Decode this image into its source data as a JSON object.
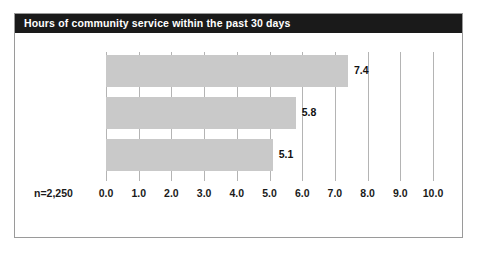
{
  "chart_data": {
    "type": "bar",
    "orientation": "horizontal",
    "title": "Hours of community service within the past 30 days",
    "categories": [
      "Heavy users",
      "Light users",
      "Nonusers"
    ],
    "values": [
      7.4,
      5.8,
      5.1
    ],
    "value_labels": [
      "7.4",
      "5.8",
      "5.1"
    ],
    "xlabel": "",
    "ylabel": "",
    "xlim": [
      0.0,
      10.0
    ],
    "xticks": [
      0.0,
      1.0,
      2.0,
      3.0,
      4.0,
      5.0,
      6.0,
      7.0,
      8.0,
      9.0,
      10.0
    ],
    "xtick_labels": [
      "0.0",
      "1.0",
      "2.0",
      "3.0",
      "4.0",
      "5.0",
      "6.0",
      "7.0",
      "8.0",
      "9.0",
      "10.0"
    ],
    "grid": "vertical",
    "legend": null,
    "annotation": "n=2,250",
    "bar_color": "#c9c9c9",
    "title_bar_color": "#1a1a1a",
    "title_text_color": "#ffffff",
    "gridline_color": "#b4b4b4",
    "frame_border_color": "#9a9a9a",
    "background_color": "#ffffff"
  }
}
